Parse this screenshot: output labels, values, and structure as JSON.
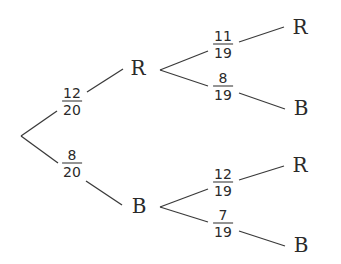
{
  "diagram": {
    "type": "probability-tree",
    "colors": {
      "line": "#3a3a3a",
      "text": "#2a2a2a",
      "background": "#ffffff"
    },
    "root": {
      "x": 21,
      "y": 136
    },
    "level1": [
      {
        "label": "R",
        "x": 138,
        "y": 68,
        "probability": {
          "numerator": "12",
          "denominator": "20",
          "x": 72,
          "y": 101
        },
        "children": [
          {
            "label": "R",
            "x": 300,
            "y": 27,
            "probability": {
              "numerator": "11",
              "denominator": "19",
              "x": 223,
              "y": 44
            }
          },
          {
            "label": "B",
            "x": 301,
            "y": 108,
            "probability": {
              "numerator": "8",
              "denominator": "19",
              "x": 223,
              "y": 86
            }
          }
        ]
      },
      {
        "label": "B",
        "x": 139,
        "y": 206,
        "probability": {
          "numerator": "8",
          "denominator": "20",
          "x": 72,
          "y": 163
        },
        "children": [
          {
            "label": "R",
            "x": 300,
            "y": 165,
            "probability": {
              "numerator": "12",
              "denominator": "19",
              "x": 223,
              "y": 182
            }
          },
          {
            "label": "B",
            "x": 301,
            "y": 245,
            "probability": {
              "numerator": "7",
              "denominator": "19",
              "x": 223,
              "y": 223
            }
          }
        ]
      }
    ]
  }
}
